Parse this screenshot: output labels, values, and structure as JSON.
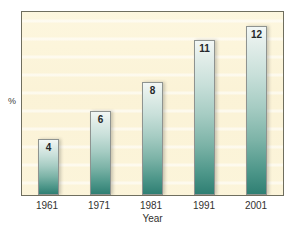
{
  "chart_data": {
    "type": "bar",
    "title": "",
    "subtitle": "",
    "xlabel": "Year",
    "ylabel": "%",
    "categories": [
      "1961",
      "1971",
      "1981",
      "1991",
      "2001"
    ],
    "values": [
      4,
      6,
      8,
      11,
      12
    ],
    "value_labels": [
      "4",
      "6",
      "8",
      "11",
      "12"
    ],
    "series": [
      {
        "name": "%",
        "values": [
          4,
          6,
          8,
          11,
          12
        ]
      }
    ],
    "ylim": [
      0,
      13
    ],
    "xlim_categories": 5,
    "grid": false,
    "legend": "none",
    "axis_tick_labels_y": [],
    "annotations": [
      {
        "category": "1961",
        "label": "4"
      },
      {
        "category": "1971",
        "label": "6"
      },
      {
        "category": "1981",
        "label": "8"
      },
      {
        "category": "1991",
        "label": "11"
      },
      {
        "category": "2001",
        "label": "12"
      }
    ]
  },
  "colors": {
    "plot_background": "#fbf3d8",
    "plot_border": "#6f6e5e",
    "bar_top": "#f2f7f5",
    "bar_bottom": "#2f7f73",
    "bar_border": "#8e9390",
    "text": "#33312f",
    "page_background": "#ffffff"
  }
}
